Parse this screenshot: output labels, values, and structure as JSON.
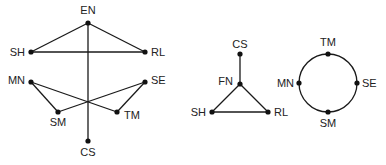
{
  "colors": {
    "line": "#1a1a1a",
    "node": "#111111",
    "text": "#222222",
    "background": "#ffffff"
  },
  "graphs": [
    {
      "id": "graph-left",
      "nodes": [
        {
          "label": "EN",
          "x": 88,
          "y": 23,
          "lx": 88,
          "ly": 14,
          "anchor": "middle"
        },
        {
          "label": "SH",
          "x": 31,
          "y": 52,
          "lx": 25,
          "ly": 56,
          "anchor": "end"
        },
        {
          "label": "RL",
          "x": 145,
          "y": 52,
          "lx": 151,
          "ly": 56,
          "anchor": "start"
        },
        {
          "label": "MN",
          "x": 31,
          "y": 82,
          "lx": 25,
          "ly": 84,
          "anchor": "end"
        },
        {
          "label": "SE",
          "x": 145,
          "y": 82,
          "lx": 151,
          "ly": 84,
          "anchor": "start"
        },
        {
          "label": "SM",
          "x": 58,
          "y": 112,
          "lx": 58,
          "ly": 126,
          "anchor": "middle"
        },
        {
          "label": "TM",
          "x": 117,
          "y": 112,
          "lx": 124,
          "ly": 119,
          "anchor": "start"
        },
        {
          "label": "CS",
          "x": 88,
          "y": 141,
          "lx": 88,
          "ly": 156,
          "anchor": "middle"
        }
      ],
      "edges": [
        [
          "EN",
          "SH"
        ],
        [
          "EN",
          "RL"
        ],
        [
          "SH",
          "RL"
        ],
        [
          "EN",
          "CS"
        ],
        [
          "MN",
          "SM"
        ],
        [
          "MN",
          "TM"
        ],
        [
          "SE",
          "SM"
        ],
        [
          "SE",
          "TM"
        ]
      ]
    },
    {
      "id": "graph-middle",
      "nodes": [
        {
          "label": "CS",
          "x": 240,
          "y": 54,
          "lx": 240,
          "ly": 48,
          "anchor": "middle"
        },
        {
          "label": "FN",
          "x": 240,
          "y": 84,
          "lx": 233,
          "ly": 85,
          "anchor": "end"
        },
        {
          "label": "SH",
          "x": 212,
          "y": 112,
          "lx": 206,
          "ly": 116,
          "anchor": "end"
        },
        {
          "label": "RL",
          "x": 268,
          "y": 112,
          "lx": 274,
          "ly": 116,
          "anchor": "start"
        }
      ],
      "edges": [
        [
          "CS",
          "FN"
        ],
        [
          "FN",
          "SH"
        ],
        [
          "FN",
          "RL"
        ],
        [
          "SH",
          "RL"
        ]
      ]
    },
    {
      "id": "graph-right",
      "circle": {
        "cx": 328,
        "cy": 83,
        "r": 29
      },
      "nodes": [
        {
          "label": "TM",
          "x": 328,
          "y": 54,
          "lx": 328,
          "ly": 46,
          "anchor": "middle"
        },
        {
          "label": "MN",
          "x": 299,
          "y": 83,
          "lx": 294,
          "ly": 87,
          "anchor": "end"
        },
        {
          "label": "SE",
          "x": 357,
          "y": 83,
          "lx": 362,
          "ly": 87,
          "anchor": "start"
        },
        {
          "label": "SM",
          "x": 328,
          "y": 112,
          "lx": 328,
          "ly": 127,
          "anchor": "middle"
        }
      ],
      "edges": []
    }
  ]
}
